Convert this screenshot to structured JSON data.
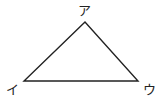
{
  "diagram": {
    "type": "triangle",
    "stroke_color": "#222222",
    "vertices": [
      {
        "id": "top",
        "label": "ア",
        "x": 85,
        "y": 22
      },
      {
        "id": "bottom-left",
        "label": "イ",
        "x": 24,
        "y": 81
      },
      {
        "id": "bottom-right",
        "label": "ウ",
        "x": 138,
        "y": 81
      }
    ],
    "labels": {
      "top": "ア",
      "bottom_left": "イ",
      "bottom_right": "ウ"
    }
  }
}
